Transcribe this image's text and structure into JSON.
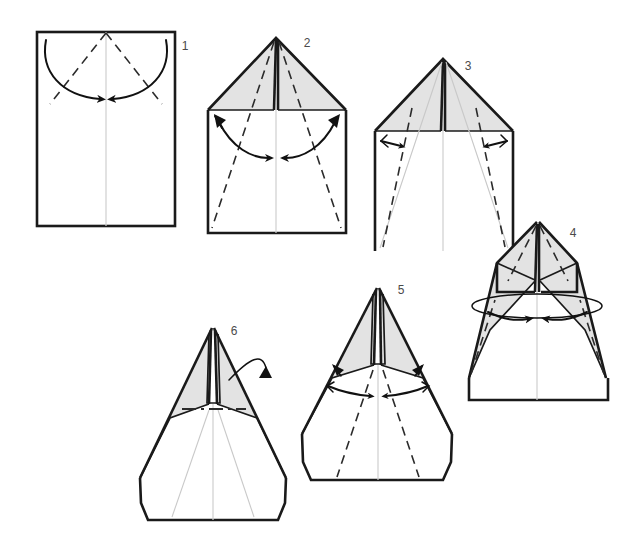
{
  "document": {
    "title": "Paper Airplane Folding Instructions",
    "type": "origami-fold-diagram",
    "background_color": "#ffffff",
    "width": 639,
    "height": 557,
    "total_steps": 6
  },
  "palette": {
    "paper_white": "#ffffff",
    "paper_shaded": "#e3e3e3",
    "outline": "#1a1a1a",
    "crease_dashed": "#2b2b2b",
    "crease_faint": "#c9c9c9",
    "center_line": "#cfcfcf",
    "arrow": "#111111",
    "label_text": "#4a4a4a"
  },
  "steps": [
    {
      "number": "1",
      "label_x": 185,
      "label_y": 50,
      "name": "step-1-rectangle-with-diagonal-creases",
      "description": "Flat rectangular sheet with vertical center crease and two dashed diagonal creases from top center; two curved arrows sweep the top corners inward to the center."
    },
    {
      "number": "2",
      "label_x": 307,
      "label_y": 47,
      "name": "step-2-corners-folded-to-center",
      "description": "Top corners folded to the center forming a shaded triangular roof; dashed creases run from the apex down to the bottom corners; double-headed curved arrows indicate the next inward fold."
    },
    {
      "number": "3",
      "label_x": 468,
      "label_y": 70,
      "name": "step-3-narrow-side-creases",
      "description": "Same roofed shape with faint previous creases showing; new dashed creases near the outer edges with short straight arrows pointing inward."
    },
    {
      "number": "4",
      "label_x": 573,
      "label_y": 237,
      "name": "step-4-wings-folded-rotate",
      "description": "Narrowed body with long shaded wing flaps tapering to points; an elliptical loop arrow indicates turning or swinging the flaps inward."
    },
    {
      "number": "5",
      "label_x": 401,
      "label_y": 294,
      "name": "step-5-dart-shape",
      "description": "Sharp dart shape with slim shaded wings and a tall central spine; small double-headed arrows near the center mark the final inner fold."
    },
    {
      "number": "6",
      "label_x": 234,
      "label_y": 335,
      "name": "step-6-fold-in-half-flip",
      "description": "Finished dart with a horizontal dash-dot mountain-fold line and a curved flip-over arrow at the upper right."
    }
  ],
  "legend": {
    "dashed_line_meaning": "valley fold / crease line",
    "dash_dot_line_meaning": "mountain fold line",
    "faint_line_meaning": "existing crease from previous step",
    "solid_arrow_meaning": "fold direction",
    "loop_arrow_meaning": "turn over / rotate"
  }
}
